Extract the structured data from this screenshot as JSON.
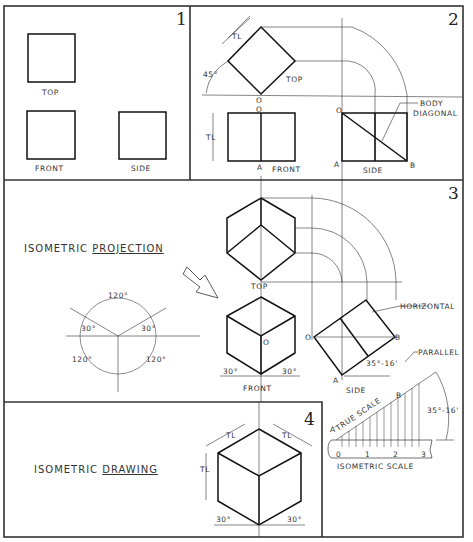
{
  "panels": [
    {
      "number": "1",
      "labels": {
        "top": "TOP",
        "front": "FRONT",
        "side": "SIDE"
      }
    },
    {
      "number": "2",
      "labels": {
        "tl_top": "TL",
        "angle": "45°",
        "top": "TOP",
        "o_top": "O",
        "o_front": "O",
        "tl_front": "TL",
        "a_front": "A",
        "front": "FRONT",
        "o_side": "O",
        "a_side": "A",
        "b_side": "B",
        "side": "SIDE",
        "body_diagonal_1": "BODY",
        "body_diagonal_2": "DIAGONAL"
      }
    },
    {
      "number": "3",
      "title_plain": "ISOMETRIC ",
      "title_underlined": "PROJECTION",
      "labels": {
        "top": "TOP",
        "front": "FRONT",
        "o_front": "O",
        "angle_front_left": "30°",
        "angle_front_right": "30°",
        "o_side": "O",
        "a_side": "A",
        "b_side": "B",
        "side": "SIDE",
        "horizontal": "HORIZONTAL",
        "parallel": "PARALLEL",
        "angle_side": "35°-16'",
        "angle_scale": "35°-16'",
        "true_scale": "TRUE SCALE",
        "a_scale": "A",
        "b_scale": "B",
        "isometric_scale": "ISOMETRIC SCALE",
        "scale_ticks": [
          "0",
          "1",
          "2",
          "3"
        ]
      },
      "axes_diagram": {
        "top": "120°",
        "left": "120°",
        "right": "120°",
        "left_30": "30°",
        "right_30": "30°"
      }
    },
    {
      "number": "4",
      "title_plain": "ISOMETRIC ",
      "title_underlined": "DRAWING",
      "labels": {
        "tl_left": "TL",
        "tl_right": "TL",
        "tl_height": "TL",
        "angle_left": "30°",
        "angle_right": "30°"
      }
    }
  ]
}
